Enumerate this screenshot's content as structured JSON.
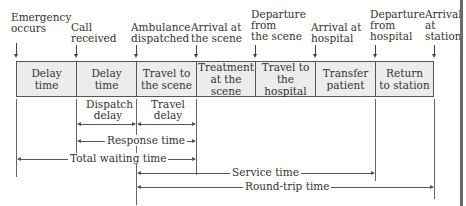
{
  "events": [
    {
      "label": "Emergency\noccurs",
      "lines": [
        "Emergency",
        "occurs"
      ]
    },
    {
      "lines": [
        "Call",
        "received"
      ]
    },
    {
      "lines": [
        "Ambulance",
        "dispatched"
      ]
    },
    {
      "lines": [
        "Arrival at",
        "the scene"
      ]
    },
    {
      "lines": [
        "Departure",
        "from",
        "the scene"
      ]
    },
    {
      "lines": [
        "Arrival at",
        "hospital"
      ]
    },
    {
      "lines": [
        "Departure",
        "from",
        "hospital"
      ]
    },
    {
      "lines": [
        "Arrival",
        "at",
        "station"
      ]
    }
  ],
  "phases": [
    {
      "lines": [
        "Delay",
        "time"
      ]
    },
    {
      "lines": [
        "Delay",
        "time"
      ]
    },
    {
      "lines": [
        "Travel to",
        "the scene"
      ]
    },
    {
      "lines": [
        "Treatment",
        "at the scene"
      ]
    },
    {
      "lines": [
        "Travel to",
        "the hospital"
      ]
    },
    {
      "lines": [
        "Transfer",
        "patient"
      ]
    },
    {
      "lines": [
        "Return",
        "to station"
      ]
    }
  ],
  "sub_intervals": [
    {
      "lines": [
        "Dispatch",
        "delay"
      ]
    },
    {
      "lines": [
        "Travel",
        "delay"
      ]
    }
  ],
  "spans": {
    "response_time": "Response time",
    "total_waiting_time": "Total waiting time",
    "service_time": "Service time",
    "round_trip_time": "Round-trip time"
  }
}
